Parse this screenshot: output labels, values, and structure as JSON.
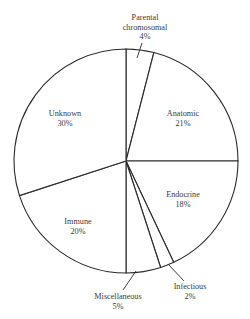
{
  "chart_data": {
    "type": "pie",
    "title": "",
    "start_angle_deg_from_top": 0,
    "direction": "clockwise",
    "categories": [
      "Parental chromosomal",
      "Anatomic",
      "Endocrine",
      "Infectious",
      "Miscellaneous",
      "Immune",
      "Unknown"
    ],
    "values": [
      4,
      21,
      18,
      2,
      5,
      20,
      30
    ],
    "unit": "%",
    "labels": [
      {
        "line1": "Parental",
        "line2": "chromosomal",
        "pct": "4%",
        "x": 145,
        "y": 20,
        "leader": [
          142,
          43,
          137,
          58
        ]
      },
      {
        "line1": "Anatomic",
        "line2": "",
        "pct": "21%",
        "x": 183,
        "y": 114,
        "leader": null
      },
      {
        "line1": "Endocrine",
        "line2": "",
        "pct": "18%",
        "x": 183,
        "y": 195,
        "leader": null
      },
      {
        "line1": "Infectious",
        "line2": "",
        "pct": "2%",
        "x": 190,
        "y": 287,
        "leader": [
          184,
          281,
          169,
          265
        ]
      },
      {
        "line1": "Miscellaneous",
        "line2": "",
        "pct": "5%",
        "x": 118,
        "y": 297,
        "leader": [
          123,
          290,
          136,
          271
        ]
      },
      {
        "line1": "Immune",
        "line2": "",
        "pct": "20%",
        "x": 78,
        "y": 222,
        "leader": null
      },
      {
        "line1": "Unknown",
        "line2": "",
        "pct": "30%",
        "x": 65,
        "y": 114,
        "leader": null
      }
    ],
    "legend": null,
    "grid": false,
    "geometry": {
      "cx": 126,
      "cy": 161,
      "r": 112
    }
  }
}
